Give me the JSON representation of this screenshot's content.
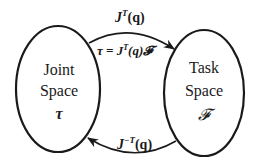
{
  "diagram": {
    "nodes": [
      {
        "id": "joint",
        "line1": "Joint",
        "line2": "Space",
        "symbol": "τ"
      },
      {
        "id": "task",
        "line1": "Task",
        "line2": "Space",
        "symbol": "𝓕"
      }
    ],
    "edges": [
      {
        "from": "joint",
        "to": "task",
        "label_outer_base": "J",
        "label_outer_sup": "T",
        "label_outer_arg": "(q)",
        "label_inner_lhs": "τ = J",
        "label_inner_sup": "T",
        "label_inner_rhs": "(q)𝓕"
      },
      {
        "from": "task",
        "to": "joint",
        "label_base": "J",
        "label_sup": "−T",
        "label_arg": "(q)"
      }
    ],
    "colors": {
      "stroke": "#1a1a1a",
      "background": "#ffffff"
    }
  }
}
